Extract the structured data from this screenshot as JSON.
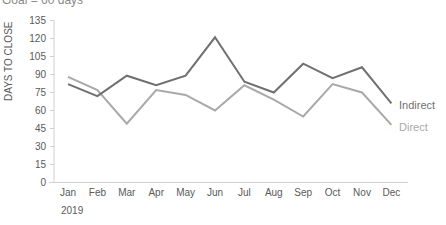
{
  "header": {
    "subtitle_cut": "Goal = 60 days"
  },
  "chart_data": {
    "type": "line",
    "title": "",
    "subtitle": "Goal = 60 days",
    "xlabel": "",
    "ylabel": "DAYS TO CLOSE",
    "categories": [
      "Jan",
      "Feb",
      "Mar",
      "Apr",
      "May",
      "Jun",
      "Jul",
      "Aug",
      "Sep",
      "Oct",
      "Nov",
      "Dec"
    ],
    "year_label": "2019",
    "ylim": [
      0,
      135
    ],
    "yticks": [
      0,
      15,
      30,
      45,
      60,
      75,
      90,
      105,
      120,
      135
    ],
    "grid": false,
    "legend_position": "direct-labels-right",
    "series": [
      {
        "name": "Indirect",
        "color": "#707070",
        "values": [
          82,
          72,
          89,
          81,
          89,
          121,
          84,
          75,
          99,
          87,
          96,
          66
        ]
      },
      {
        "name": "Direct",
        "color": "#a9a9a9",
        "values": [
          88,
          77,
          49,
          77,
          73,
          60,
          81,
          69,
          55,
          82,
          75,
          48
        ]
      }
    ]
  }
}
